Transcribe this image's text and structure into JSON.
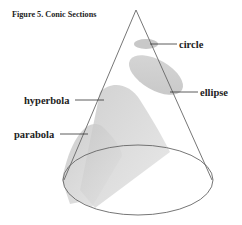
{
  "figure": {
    "title": "Figure 5.  Conic Sections",
    "labels": {
      "circle": "circle",
      "ellipse": "ellipse",
      "hyperbola": "hyperbola",
      "parabola": "parabola"
    }
  },
  "colors": {
    "outline": "#666666",
    "fill_light": "#d9d9d9",
    "fill_mid": "#c4c4c4",
    "text": "#222222"
  }
}
